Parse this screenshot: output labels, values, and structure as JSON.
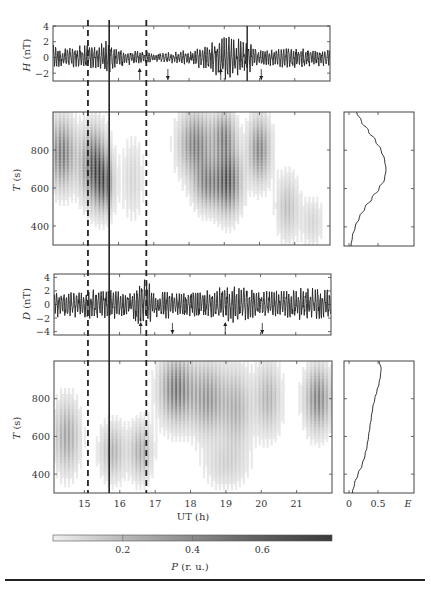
{
  "chart_data": [
    {
      "id": "H",
      "type": "line",
      "title": "",
      "xlabel": "",
      "ylabel": "H (nT)",
      "ylabel_var": "H",
      "ylabel_unit": " (nT)",
      "ylim": [
        -3,
        4
      ],
      "yticks": [
        4,
        2,
        0,
        -2
      ],
      "xlim": [
        14.14,
        22.0
      ],
      "xticks": [
        15,
        16,
        17,
        18,
        19,
        20,
        21
      ],
      "description": "Geomagnetic H-component pulsation record, amplitude mostly within ±2 nT, bursts up to ~3.5 nT near 19–19.7 UT",
      "envelope": [
        {
          "x": 14.2,
          "amp": 1.6
        },
        {
          "x": 14.6,
          "amp": 1.4
        },
        {
          "x": 15.0,
          "amp": 1.6
        },
        {
          "x": 15.4,
          "amp": 1.5
        },
        {
          "x": 15.7,
          "amp": 2.3
        },
        {
          "x": 16.0,
          "amp": 1.3
        },
        {
          "x": 16.5,
          "amp": 0.9
        },
        {
          "x": 17.0,
          "amp": 0.7
        },
        {
          "x": 17.5,
          "amp": 0.8
        },
        {
          "x": 18.0,
          "amp": 1.0
        },
        {
          "x": 18.5,
          "amp": 1.8
        },
        {
          "x": 19.0,
          "amp": 3.0
        },
        {
          "x": 19.3,
          "amp": 2.6
        },
        {
          "x": 19.7,
          "amp": 2.2
        },
        {
          "x": 20.0,
          "amp": 1.0
        },
        {
          "x": 20.5,
          "amp": 1.3
        },
        {
          "x": 21.0,
          "amp": 1.4
        },
        {
          "x": 21.5,
          "amp": 1.2
        },
        {
          "x": 22.0,
          "amp": 1.2
        }
      ],
      "arrows": [
        {
          "x": 16.6,
          "dir": "up"
        },
        {
          "x": 17.4,
          "dir": "down"
        },
        {
          "x": 18.9,
          "dir": "up"
        },
        {
          "x": 20.05,
          "dir": "down"
        }
      ],
      "extra_solid_line_x": 19.65
    },
    {
      "id": "T_H",
      "type": "heatmap",
      "title": "",
      "xlabel": "",
      "ylabel": "T (s)",
      "ylabel_var": "T",
      "ylabel_unit": " (s)",
      "ylim": [
        300,
        1000
      ],
      "yticks": [
        800,
        600,
        400
      ],
      "xlim": [
        14.14,
        22.0
      ],
      "colorscale": "grayscale P (r.u.) 0–0.8",
      "blobs": [
        {
          "x": 14.4,
          "T": 780,
          "wx": 0.35,
          "wT": 170,
          "p": 0.55
        },
        {
          "x": 15.3,
          "T": 720,
          "wx": 0.35,
          "wT": 180,
          "p": 0.7
        },
        {
          "x": 15.6,
          "T": 620,
          "wx": 0.25,
          "wT": 140,
          "p": 0.5
        },
        {
          "x": 16.4,
          "T": 650,
          "wx": 0.3,
          "wT": 200,
          "p": 0.15
        },
        {
          "x": 18.2,
          "T": 830,
          "wx": 0.45,
          "wT": 160,
          "p": 0.55
        },
        {
          "x": 18.5,
          "T": 620,
          "wx": 0.35,
          "wT": 120,
          "p": 0.45
        },
        {
          "x": 19.1,
          "T": 640,
          "wx": 0.35,
          "wT": 160,
          "p": 0.7
        },
        {
          "x": 19.0,
          "T": 880,
          "wx": 0.3,
          "wT": 120,
          "p": 0.45
        },
        {
          "x": 20.0,
          "T": 800,
          "wx": 0.3,
          "wT": 160,
          "p": 0.5
        },
        {
          "x": 20.8,
          "T": 500,
          "wx": 0.3,
          "wT": 160,
          "p": 0.25
        },
        {
          "x": 21.5,
          "T": 420,
          "wx": 0.3,
          "wT": 120,
          "p": 0.15
        }
      ]
    },
    {
      "id": "E_H",
      "type": "line",
      "title": "",
      "xlabel": "",
      "ylabel": "",
      "xlim": [
        0,
        1.0
      ],
      "ylim": [
        300,
        1000
      ],
      "points": [
        {
          "T": 1000,
          "E": 0.18
        },
        {
          "T": 950,
          "E": 0.25
        },
        {
          "T": 900,
          "E": 0.35
        },
        {
          "T": 850,
          "E": 0.45
        },
        {
          "T": 800,
          "E": 0.53
        },
        {
          "T": 750,
          "E": 0.58
        },
        {
          "T": 700,
          "E": 0.6
        },
        {
          "T": 650,
          "E": 0.58
        },
        {
          "T": 600,
          "E": 0.5
        },
        {
          "T": 550,
          "E": 0.4
        },
        {
          "T": 500,
          "E": 0.3
        },
        {
          "T": 450,
          "E": 0.22
        },
        {
          "T": 400,
          "E": 0.16
        },
        {
          "T": 350,
          "E": 0.12
        },
        {
          "T": 300,
          "E": 0.1
        }
      ]
    },
    {
      "id": "D",
      "type": "line",
      "title": "",
      "xlabel": "",
      "ylabel": "D (nT)",
      "ylabel_var": "D",
      "ylabel_unit": " (nT)",
      "ylim": [
        -4.5,
        4.5
      ],
      "yticks": [
        4,
        2,
        0,
        -2,
        -4
      ],
      "xlim": [
        14.14,
        22.0
      ],
      "xticks": [
        15,
        16,
        17,
        18,
        19,
        20,
        21
      ],
      "description": "Geomagnetic D-component pulsation record, amplitude ~±2.5 nT with spikes to ~4 nT at 16.75 UT",
      "envelope": [
        {
          "x": 14.2,
          "amp": 2.0
        },
        {
          "x": 15.0,
          "amp": 2.2
        },
        {
          "x": 15.7,
          "amp": 2.4
        },
        {
          "x": 16.2,
          "amp": 1.7
        },
        {
          "x": 16.75,
          "amp": 4.0
        },
        {
          "x": 17.0,
          "amp": 2.0
        },
        {
          "x": 17.5,
          "amp": 2.3
        },
        {
          "x": 18.0,
          "amp": 2.0
        },
        {
          "x": 18.5,
          "amp": 2.2
        },
        {
          "x": 19.0,
          "amp": 2.8
        },
        {
          "x": 19.5,
          "amp": 2.6
        },
        {
          "x": 20.0,
          "amp": 2.0
        },
        {
          "x": 20.5,
          "amp": 2.2
        },
        {
          "x": 21.0,
          "amp": 2.3
        },
        {
          "x": 21.5,
          "amp": 3.0
        },
        {
          "x": 22.0,
          "amp": 2.2
        }
      ],
      "arrows": [
        {
          "x": 16.6,
          "dir": "up"
        },
        {
          "x": 17.5,
          "dir": "down"
        },
        {
          "x": 19.0,
          "dir": "up"
        },
        {
          "x": 20.05,
          "dir": "down"
        }
      ]
    },
    {
      "id": "T_D",
      "type": "heatmap",
      "title": "",
      "xlabel": "UT (h)",
      "ylabel": "T (s)",
      "ylabel_var": "T",
      "ylabel_unit": " (s)",
      "ylim": [
        300,
        1000
      ],
      "yticks": [
        800,
        600,
        400
      ],
      "xlim": [
        14.14,
        22.0
      ],
      "xticks": [
        15,
        16,
        17,
        18,
        19,
        20,
        21
      ],
      "colorscale": "grayscale P (r.u.) 0–0.8",
      "blobs": [
        {
          "x": 14.5,
          "T": 600,
          "wx": 0.35,
          "wT": 180,
          "p": 0.35
        },
        {
          "x": 15.8,
          "T": 520,
          "wx": 0.35,
          "wT": 140,
          "p": 0.3
        },
        {
          "x": 16.6,
          "T": 520,
          "wx": 0.3,
          "wT": 140,
          "p": 0.35
        },
        {
          "x": 17.6,
          "T": 850,
          "wx": 0.45,
          "wT": 170,
          "p": 0.55
        },
        {
          "x": 18.5,
          "T": 800,
          "wx": 0.45,
          "wT": 180,
          "p": 0.4
        },
        {
          "x": 19.3,
          "T": 750,
          "wx": 0.4,
          "wT": 200,
          "p": 0.3
        },
        {
          "x": 20.2,
          "T": 800,
          "wx": 0.35,
          "wT": 180,
          "p": 0.3
        },
        {
          "x": 21.6,
          "T": 800,
          "wx": 0.35,
          "wT": 160,
          "p": 0.5
        },
        {
          "x": 19.0,
          "T": 450,
          "wx": 0.6,
          "wT": 120,
          "p": 0.15
        }
      ]
    },
    {
      "id": "E_D",
      "type": "line",
      "title": "",
      "xlabel": "E",
      "ylabel": "",
      "xlim": [
        0,
        1.0
      ],
      "xticks": [
        0,
        0.5
      ],
      "xticklabels": [
        "0",
        "0.5"
      ],
      "ylim": [
        300,
        1000
      ],
      "points": [
        {
          "T": 1000,
          "E": 0.5
        },
        {
          "T": 960,
          "E": 0.53
        },
        {
          "T": 920,
          "E": 0.52
        },
        {
          "T": 880,
          "E": 0.5
        },
        {
          "T": 840,
          "E": 0.47
        },
        {
          "T": 800,
          "E": 0.44
        },
        {
          "T": 750,
          "E": 0.41
        },
        {
          "T": 700,
          "E": 0.39
        },
        {
          "T": 650,
          "E": 0.37
        },
        {
          "T": 600,
          "E": 0.35
        },
        {
          "T": 550,
          "E": 0.33
        },
        {
          "T": 500,
          "E": 0.3
        },
        {
          "T": 450,
          "E": 0.26
        },
        {
          "T": 400,
          "E": 0.2
        },
        {
          "T": 350,
          "E": 0.15
        },
        {
          "T": 300,
          "E": 0.12
        }
      ]
    }
  ],
  "markers": {
    "dashed_lines_ut": [
      15.1,
      16.75
    ],
    "solid_line_ut": 15.7
  },
  "colorbar": {
    "label_var": "P",
    "label_unit": " (r. u.)",
    "range": [
      0,
      0.8
    ],
    "ticks": [
      0.2,
      0.4,
      0.6
    ],
    "tick_labels": [
      "0.2",
      "0.4",
      "0.6"
    ],
    "color_low": "#eeeeee",
    "color_high": "#3a3a3a"
  },
  "labels": {
    "h_ylabel_var": "H",
    "h_ylabel_unit": " (nT)",
    "t_ylabel_var": "T",
    "t_ylabel_unit": " (s)",
    "d_ylabel_var": "D",
    "d_ylabel_unit": " (nT)",
    "ut_label": "UT (h)",
    "e_label": "E",
    "p_label_var": "P",
    "p_label_unit": " (r. u.)"
  }
}
